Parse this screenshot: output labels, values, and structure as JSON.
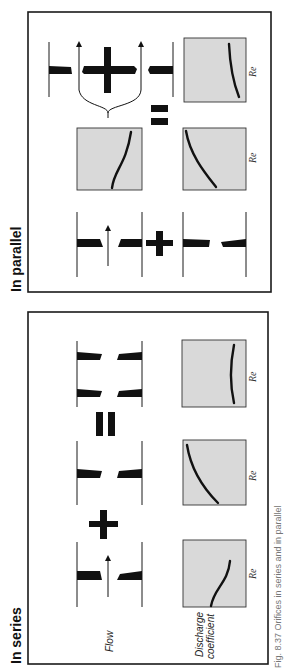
{
  "figure": {
    "orientation": "rotated-90-ccw",
    "caption": "Fig. 8.37 Orifices in series and in parallel"
  },
  "series_panel": {
    "title": "In series",
    "row_labels": {
      "flow": "Flow",
      "discharge_line1": "Discharge",
      "discharge_line2": "coefficient"
    },
    "operators": [
      "plus",
      "equals"
    ],
    "plots": [
      {
        "id": "orifice-1",
        "axis_label": "Re",
        "curve": "s-curve-rising"
      },
      {
        "id": "orifice-2",
        "axis_label": "Re",
        "curve": "falling-concave"
      },
      {
        "id": "combined",
        "axis_label": "Re",
        "curve": "flat-slight-arc"
      }
    ]
  },
  "parallel_panel": {
    "title": "In parallel",
    "operators": [
      "plus",
      "equals",
      "plus"
    ],
    "plots": [
      {
        "id": "orifice-1",
        "axis_label": "",
        "curve": "s-curve-rising"
      },
      {
        "id": "orifice-2",
        "axis_label": "Re",
        "curve": "falling-concave"
      },
      {
        "id": "combined",
        "axis_label": "Re",
        "curve": "gently-falling"
      }
    ]
  },
  "colors": {
    "ink": "#111111",
    "plot_fill": "#d9d9d9",
    "background": "#ffffff"
  }
}
